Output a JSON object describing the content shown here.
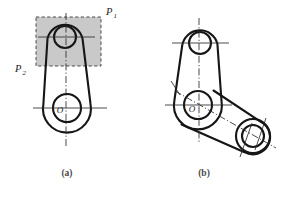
{
  "figure": {
    "background_color": "#ffffff",
    "line_color": "#161616",
    "shade_color": "#c9c9c9",
    "centerline_color": "#2b2b2b",
    "panels": [
      {
        "id": "a",
        "caption": "(a)",
        "caption_x": 67,
        "caption_y": 176,
        "description": "Two-lug rocker arm with shaded cutting-plane region",
        "labels": [
          {
            "name": "plane-p1",
            "base": "P",
            "sub": "1",
            "x": 106,
            "y": 15
          },
          {
            "name": "plane-p2",
            "base": "P",
            "sub": "2",
            "x": 15,
            "y": 72
          },
          {
            "name": "center-o",
            "base": "O",
            "sub": "",
            "x": 60,
            "y": 113
          }
        ],
        "small_boss": {
          "cx": 65,
          "cy": 37,
          "r_outer": 18,
          "r_hole": 11
        },
        "large_boss": {
          "cx": 67,
          "cy": 108,
          "r_outer": 24,
          "r_hole": 14
        },
        "shaded_rect": {
          "x": 36,
          "y": 17,
          "w": 65,
          "h": 49
        }
      },
      {
        "id": "b",
        "caption": "(b)",
        "caption_x": 204,
        "caption_y": 176,
        "description": "Same part with third boss arm rotated toward lower right",
        "labels": [
          {
            "name": "center-o",
            "base": "O",
            "sub": "",
            "x": 192,
            "y": 112
          }
        ],
        "top_boss": {
          "cx": 200,
          "cy": 43,
          "r_outer": 18,
          "r_hole": 11
        },
        "main_boss": {
          "cx": 198,
          "cy": 105,
          "r_outer": 24,
          "r_hole": 14
        },
        "corner_boss": {
          "cx": 253,
          "cy": 136,
          "r_outer": 17,
          "r_hole": 11
        }
      }
    ]
  }
}
